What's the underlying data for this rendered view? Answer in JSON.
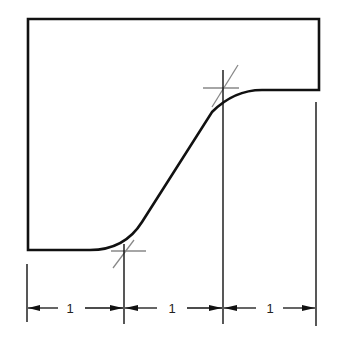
{
  "diagram": {
    "type": "technical-drawing",
    "colors": {
      "outline": "#111111",
      "construction": "#888888",
      "background": "#ffffff"
    },
    "dimensions": [
      {
        "label": "1"
      },
      {
        "label": "1"
      },
      {
        "label": "1"
      }
    ],
    "tangent_points": [
      {
        "name": "lower-tangent-point"
      },
      {
        "name": "upper-tangent-point"
      }
    ]
  }
}
